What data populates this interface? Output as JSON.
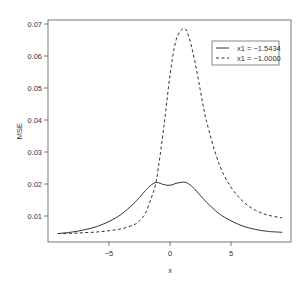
{
  "chart_data": {
    "type": "line",
    "title": "",
    "xlabel": "x",
    "ylabel": "MSE",
    "xlim": [
      -9.5,
      9.5
    ],
    "ylim": [
      0.0027,
      0.0717
    ],
    "grid": false,
    "legend_position": "top-right",
    "x_ticks": [
      -5,
      0,
      5
    ],
    "x_tick_labels": [
      "-5",
      "0",
      "5"
    ],
    "y_ticks": [
      0.01,
      0.02,
      0.03,
      0.04,
      0.05,
      0.06,
      0.07
    ],
    "y_tick_labels": [
      "0.01",
      "0.02",
      "0.03",
      "0.04",
      "0.05",
      "0.06",
      "0.07"
    ],
    "x": [
      -9.2,
      -8,
      -7,
      -6,
      -5,
      -4,
      -3,
      -2.5,
      -2,
      -1.5,
      -1.1,
      -0.5,
      0,
      0.5,
      1.1,
      1.5,
      2,
      2.5,
      3,
      4,
      5,
      6,
      7,
      8,
      9.2
    ],
    "series": [
      {
        "name": "x1 = −1.5434",
        "style": "solid",
        "values": [
          0.0045,
          0.005,
          0.0057,
          0.0067,
          0.0083,
          0.0105,
          0.0138,
          0.0158,
          0.018,
          0.0198,
          0.0205,
          0.0198,
          0.0196,
          0.0202,
          0.0206,
          0.0201,
          0.0185,
          0.0164,
          0.0143,
          0.0108,
          0.0085,
          0.0068,
          0.0058,
          0.0052,
          0.0049
        ]
      },
      {
        "name": "x1 = −1.0000",
        "style": "dashed",
        "values": [
          0.0045,
          0.0046,
          0.0048,
          0.005,
          0.0054,
          0.006,
          0.0072,
          0.0085,
          0.011,
          0.016,
          0.0215,
          0.038,
          0.054,
          0.065,
          0.0686,
          0.0665,
          0.059,
          0.049,
          0.0395,
          0.0265,
          0.019,
          0.0145,
          0.0118,
          0.0103,
          0.0094
        ]
      }
    ]
  },
  "axes": {
    "xlabel": "x",
    "ylabel": "MSE"
  },
  "legend": {
    "items": [
      {
        "label": "x1 = −1.5434",
        "style": "solid"
      },
      {
        "label": "x1 = −1.0000",
        "style": "dashed"
      }
    ]
  },
  "colors": {
    "line": "#333333",
    "axis": "#555555",
    "text": "#333333"
  }
}
